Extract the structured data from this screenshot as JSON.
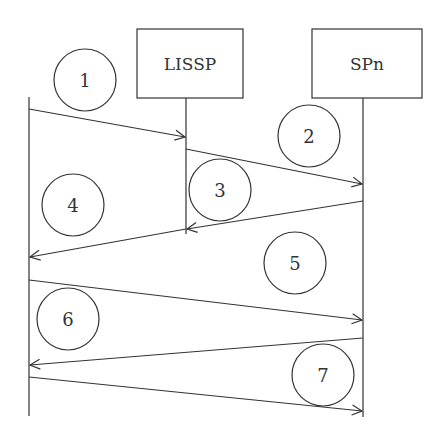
{
  "diagram": {
    "type": "sequence",
    "participants": [
      {
        "id": "client",
        "label": ""
      },
      {
        "id": "lissp",
        "label": "LISSP"
      },
      {
        "id": "spn",
        "label": "SPn"
      }
    ],
    "steps": [
      {
        "num": "1",
        "from": "client",
        "to": "lissp"
      },
      {
        "num": "2",
        "from": "lissp",
        "to": "spn"
      },
      {
        "num": "3",
        "from": "spn",
        "to": "lissp"
      },
      {
        "num": "4",
        "from": "lissp",
        "to": "client"
      },
      {
        "num": "5",
        "from": "client",
        "to": "spn"
      },
      {
        "num": "6",
        "from": "client",
        "to": "spn"
      },
      {
        "num": "7",
        "from": "spn",
        "to": "client"
      }
    ],
    "colors": {
      "stroke": "#333333",
      "background": "#ffffff"
    }
  }
}
